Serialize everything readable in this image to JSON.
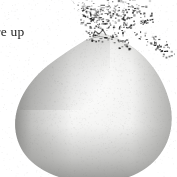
{
  "page": {
    "kind": "scanned-book-illustration",
    "width": 177,
    "height": 177,
    "background_color": "#ffffff"
  },
  "caption": {
    "text_fragment": "re up",
    "note": "body text clipped by left page edge",
    "color": "#1d1d1d",
    "x": -4,
    "y": 25,
    "font_size_px": 13.5
  },
  "illustration": {
    "subject": "fruit",
    "description": "rounded pear-like fruit with small stem nub at top, soft airbrushed halftone shading, lit from upper centre",
    "colors": {
      "highlight": "#fcfcfc",
      "body_light": "#f1f1f0",
      "body_mid": "#d4d4d2",
      "body_shadow": "#a8a8a6",
      "edge_shadow": "#8e8e8c",
      "outline": "#7c7c7a",
      "stem": "#6e6e6c"
    },
    "geometry": {
      "center_x": 92,
      "center_y": 116,
      "radius_x": 78,
      "radius_y": 64,
      "stem_x": 98,
      "stem_y": 31,
      "top_apex_y": 33,
      "bottom_y": 176,
      "left_edge_x": 14,
      "right_edge_x": 172
    }
  },
  "speckle_field": {
    "description": "dense cloud of dark ink specks / scanner noise spraying up and to the right from the stem",
    "color": "#1a1a1a",
    "count": 620,
    "origin_x": 100,
    "origin_y": 32,
    "spread_x": 78,
    "spread_y": 46,
    "min_size_px": 0.5,
    "max_size_px": 2.4
  },
  "paper_grain": {
    "description": "faint halftone paper texture over whole scan",
    "color": "#b9b9b7",
    "count": 900,
    "opacity": 0.3
  }
}
